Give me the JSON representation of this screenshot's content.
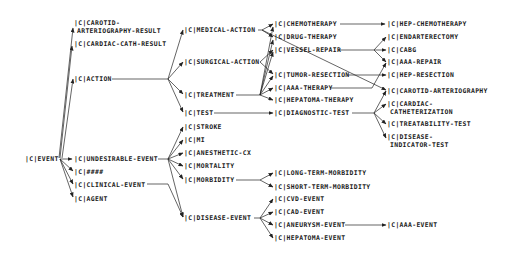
{
  "diagram": {
    "type": "concept-hierarchy",
    "nodes": {
      "event": "|C|EVENT",
      "carotid_result_1": "|C|CAROTID-",
      "carotid_result_2": "ARTERIOGRAPHY-RESULT",
      "cardiac_cath_result": "|C|CARDIAC-CATH-RESULT",
      "action": "|C|ACTION",
      "undesirable_event": "|C|UNDESIRABLE-EVENT",
      "hidden": "|C|####",
      "clinical_event": "|C|CLINICAL-EVENT",
      "agent": "|C|AGENT",
      "medical_action": "|C|MEDICAL-ACTION",
      "surgical_action": "|C|SURGICAL-ACTION",
      "treatment": "|C|TREATMENT",
      "test": "|C|TEST",
      "stroke": "|C|STROKE",
      "mi": "|C|MI",
      "anesthetic_cx": "|C|ANESTHETIC-CX",
      "mortality": "|C|MORTALITY",
      "morbidity": "|C|MORBIDITY",
      "disease_event": "|C|DISEASE-EVENT",
      "chemotherapy": "|C|CHEMOTHERAPY",
      "drug_therapy": "|C|DRUG-THERAPY",
      "vessel_repair": "|C|VESSEL-REPAIR",
      "tumor_resection": "|C|TUMOR-RESECTION",
      "aaa_therapy": "|C|AAA-THERAPY",
      "hepatoma_therapy": "|C|HEPATOMA-THERAPY",
      "diagnostic_test": "|C|DIAGNOSTIC-TEST",
      "long_term_morbidity": "|C|LONG-TERM-MORBIDITY",
      "short_term_morbidity": "|C|SHORT-TERM-MORBIDITY",
      "cvd_event": "|C|CVD-EVENT",
      "cad_event": "|C|CAD-EVENT",
      "aneurysm_event": "|C|ANEURYSM-EVENT",
      "hepatoma_event": "|C|HEPATOMA-EVENT",
      "hep_chemotherapy": "|C|HEP-CHEMOTHERAPY",
      "endarterectomy": "|C|ENDARTERECTOMY",
      "cabg": "|C|CABG",
      "aaa_repair": "|C|AAA-REPAIR",
      "hep_resection": "|C|HEP-RESECTION",
      "carotid_arteriography": "|C|CAROTID-ARTERIOGRAPHY",
      "cardiac_cath_1": "|C|CARDIAC-",
      "cardiac_cath_2": "CATHETERIZATION",
      "treatability_test": "|C|TREATABILITY-TEST",
      "disease_indicator_1": "|C|DISEASE-",
      "disease_indicator_2": "INDICATOR-TEST",
      "aaa_event": "|C|AAA-EVENT"
    },
    "edges": [
      [
        "EVENT",
        "CAROTID-ARTERIOGRAPHY-RESULT"
      ],
      [
        "EVENT",
        "CARDIAC-CATH-RESULT"
      ],
      [
        "EVENT",
        "ACTION"
      ],
      [
        "EVENT",
        "UNDESIRABLE-EVENT"
      ],
      [
        "EVENT",
        "####"
      ],
      [
        "EVENT",
        "CLINICAL-EVENT"
      ],
      [
        "EVENT",
        "AGENT"
      ],
      [
        "ACTION",
        "MEDICAL-ACTION"
      ],
      [
        "ACTION",
        "SURGICAL-ACTION"
      ],
      [
        "ACTION",
        "TREATMENT"
      ],
      [
        "ACTION",
        "TEST"
      ],
      [
        "UNDESIRABLE-EVENT",
        "STROKE"
      ],
      [
        "UNDESIRABLE-EVENT",
        "MI"
      ],
      [
        "UNDESIRABLE-EVENT",
        "ANESTHETIC-CX"
      ],
      [
        "UNDESIRABLE-EVENT",
        "MORTALITY"
      ],
      [
        "UNDESIRABLE-EVENT",
        "MORBIDITY"
      ],
      [
        "UNDESIRABLE-EVENT",
        "DISEASE-EVENT"
      ],
      [
        "CLINICAL-EVENT",
        "DISEASE-EVENT"
      ],
      [
        "MEDICAL-ACTION",
        "CHEMOTHERAPY"
      ],
      [
        "MEDICAL-ACTION",
        "DRUG-THERAPY"
      ],
      [
        "MEDICAL-ACTION",
        "CAROTID-ARTERIOGRAPHY"
      ],
      [
        "SURGICAL-ACTION",
        "VESSEL-REPAIR"
      ],
      [
        "SURGICAL-ACTION",
        "TUMOR-RESECTION"
      ],
      [
        "TREATMENT",
        "CHEMOTHERAPY"
      ],
      [
        "TREATMENT",
        "DRUG-THERAPY"
      ],
      [
        "TREATMENT",
        "VESSEL-REPAIR"
      ],
      [
        "TREATMENT",
        "TUMOR-RESECTION"
      ],
      [
        "TREATMENT",
        "AAA-THERAPY"
      ],
      [
        "TREATMENT",
        "HEPATOMA-THERAPY"
      ],
      [
        "TEST",
        "DIAGNOSTIC-TEST"
      ],
      [
        "CHEMOTHERAPY",
        "HEP-CHEMOTHERAPY"
      ],
      [
        "VESSEL-REPAIR",
        "ENDARTERECTOMY"
      ],
      [
        "VESSEL-REPAIR",
        "CABG"
      ],
      [
        "VESSEL-REPAIR",
        "AAA-REPAIR"
      ],
      [
        "TUMOR-RESECTION",
        "HEP-RESECTION"
      ],
      [
        "AAA-THERAPY",
        "AAA-REPAIR"
      ],
      [
        "DIAGNOSTIC-TEST",
        "CAROTID-ARTERIOGRAPHY"
      ],
      [
        "DIAGNOSTIC-TEST",
        "CARDIAC-CATHETERIZATION"
      ],
      [
        "DIAGNOSTIC-TEST",
        "TREATABILITY-TEST"
      ],
      [
        "DIAGNOSTIC-TEST",
        "DISEASE-INDICATOR-TEST"
      ],
      [
        "MORBIDITY",
        "LONG-TERM-MORBIDITY"
      ],
      [
        "MORBIDITY",
        "SHORT-TERM-MORBIDITY"
      ],
      [
        "DISEASE-EVENT",
        "CVD-EVENT"
      ],
      [
        "DISEASE-EVENT",
        "CAD-EVENT"
      ],
      [
        "DISEASE-EVENT",
        "ANEURYSM-EVENT"
      ],
      [
        "DISEASE-EVENT",
        "HEPATOMA-EVENT"
      ],
      [
        "ANEURYSM-EVENT",
        "AAA-EVENT"
      ]
    ]
  }
}
